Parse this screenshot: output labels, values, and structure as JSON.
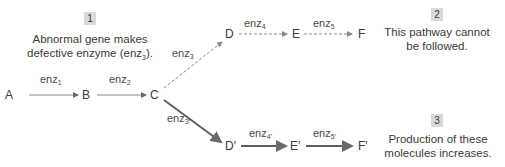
{
  "nodes": {
    "A": "A",
    "B": "B",
    "C": "C",
    "D": "D",
    "E": "E",
    "F": "F",
    "D_prime": "D′",
    "E_prime": "E′",
    "F_prime": "F′"
  },
  "enzymes": {
    "enz1": {
      "base": "enz",
      "sub": "1"
    },
    "enz2": {
      "base": "enz",
      "sub": "2"
    },
    "enz3_up": {
      "base": "enz",
      "sub": "3"
    },
    "enz4": {
      "base": "enz",
      "sub": "4"
    },
    "enz5": {
      "base": "enz",
      "sub": "5"
    },
    "enz3_prime": {
      "base": "enz",
      "sub": "3′"
    },
    "enz4_prime": {
      "base": "enz",
      "sub": "4′"
    },
    "enz5_prime": {
      "base": "enz",
      "sub": "5′"
    }
  },
  "annotations": [
    {
      "number": "1",
      "line1": "Abnormal gene makes",
      "line2_pre": "defective enzyme (enz",
      "line2_sub": "3",
      "line2_post": ")."
    },
    {
      "number": "2",
      "line1": "This pathway cannot",
      "line2": "be followed."
    },
    {
      "number": "3",
      "line1": "Production of these",
      "line2": "molecules increases."
    }
  ],
  "colors": {
    "normal_arrow": "#7a7a7a",
    "blocked_arrow": "#8a8a8a",
    "increased_arrow": "#5a5a5a",
    "badge_bg": "#d9d9d9"
  }
}
